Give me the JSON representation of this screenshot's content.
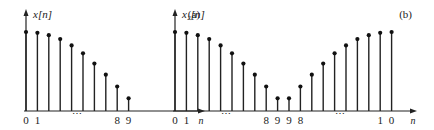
{
  "chart_data": [
    {
      "type": "stem",
      "panel_label": "(a)",
      "ylabel": "x[n]",
      "xlabel": "n",
      "x": [
        0,
        1,
        2,
        3,
        4,
        5,
        6,
        7,
        8,
        9
      ],
      "values": [
        1.0,
        0.99,
        0.96,
        0.91,
        0.83,
        0.73,
        0.6,
        0.46,
        0.31,
        0.16
      ],
      "tick_labels": [
        "0",
        "1",
        "⋯",
        "8",
        "9"
      ],
      "tick_positions": [
        0,
        1,
        4.5,
        8,
        9
      ]
    },
    {
      "type": "stem",
      "panel_label": "(b)",
      "ylabel": "x₂[n]",
      "xlabel": "n",
      "x": [
        0,
        1,
        2,
        3,
        4,
        5,
        6,
        7,
        8,
        9,
        10,
        11,
        12,
        13,
        14,
        15,
        16,
        17,
        18,
        19
      ],
      "values": [
        1.0,
        0.99,
        0.96,
        0.91,
        0.83,
        0.73,
        0.6,
        0.46,
        0.31,
        0.16,
        0.16,
        0.31,
        0.46,
        0.6,
        0.73,
        0.83,
        0.91,
        0.96,
        0.99,
        1.0
      ],
      "tick_labels": [
        "0",
        "1",
        "⋯",
        "8",
        "9",
        "9",
        "8",
        "⋯",
        "1",
        "0"
      ],
      "tick_positions": [
        0,
        1,
        4.5,
        8,
        9,
        10,
        11,
        14.5,
        18,
        19
      ]
    }
  ]
}
